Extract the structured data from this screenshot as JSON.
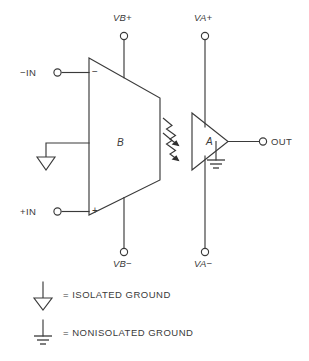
{
  "diagram": {
    "line_color": "#3a3a3a",
    "background": "#ffffff",
    "blocks": [
      {
        "id": "B",
        "label": "B",
        "shape": "trapezoid",
        "role": "isolated-input-amplifier"
      },
      {
        "id": "A",
        "label": "A",
        "shape": "triangle",
        "role": "output-amplifier"
      }
    ],
    "coupling": {
      "name": "optical-coupling",
      "symbol": "zigzag-arrows",
      "count": 2,
      "direction": "left-to-right"
    },
    "inputs": [
      {
        "label": "−IN",
        "polarity_mark": "−"
      },
      {
        "label": "+IN",
        "polarity_mark": "+"
      }
    ],
    "supplies": [
      {
        "label": "VB+",
        "side": "top",
        "block": "B"
      },
      {
        "label": "VB−",
        "side": "bottom",
        "block": "B"
      },
      {
        "label": "VA+",
        "side": "top",
        "block": "A"
      },
      {
        "label": "VA−",
        "side": "bottom",
        "block": "A"
      }
    ],
    "outputs": [
      {
        "label": "OUT"
      }
    ],
    "grounds": [
      {
        "type": "isolated",
        "attached_to": "B"
      },
      {
        "type": "nonisolated",
        "attached_to": "A"
      }
    ]
  },
  "legend": {
    "items": [
      {
        "symbol": "isolated-ground-symbol",
        "text": "= ISOLATED GROUND"
      },
      {
        "symbol": "nonisolated-ground-symbol",
        "text": "= NONISOLATED GROUND"
      }
    ]
  }
}
